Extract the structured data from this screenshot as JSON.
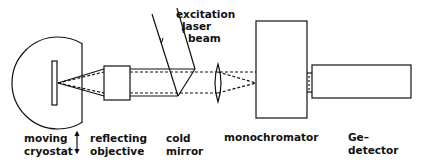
{
  "diagram": {
    "components": [
      {
        "id": "cryostat",
        "label_lines": [
          "moving",
          "cryostat"
        ]
      },
      {
        "id": "objective",
        "label_lines": [
          "reflecting",
          "objective"
        ]
      },
      {
        "id": "mirror",
        "label_lines": [
          "cold",
          "mirror"
        ]
      },
      {
        "id": "monochromator",
        "label_lines": [
          "monochromator"
        ]
      },
      {
        "id": "detector",
        "label_lines": [
          "Ge–",
          "detector"
        ]
      }
    ],
    "beam_label_lines": [
      "excitation",
      "laser",
      "beam"
    ],
    "motion_indicator": "double-arrow-vertical"
  }
}
